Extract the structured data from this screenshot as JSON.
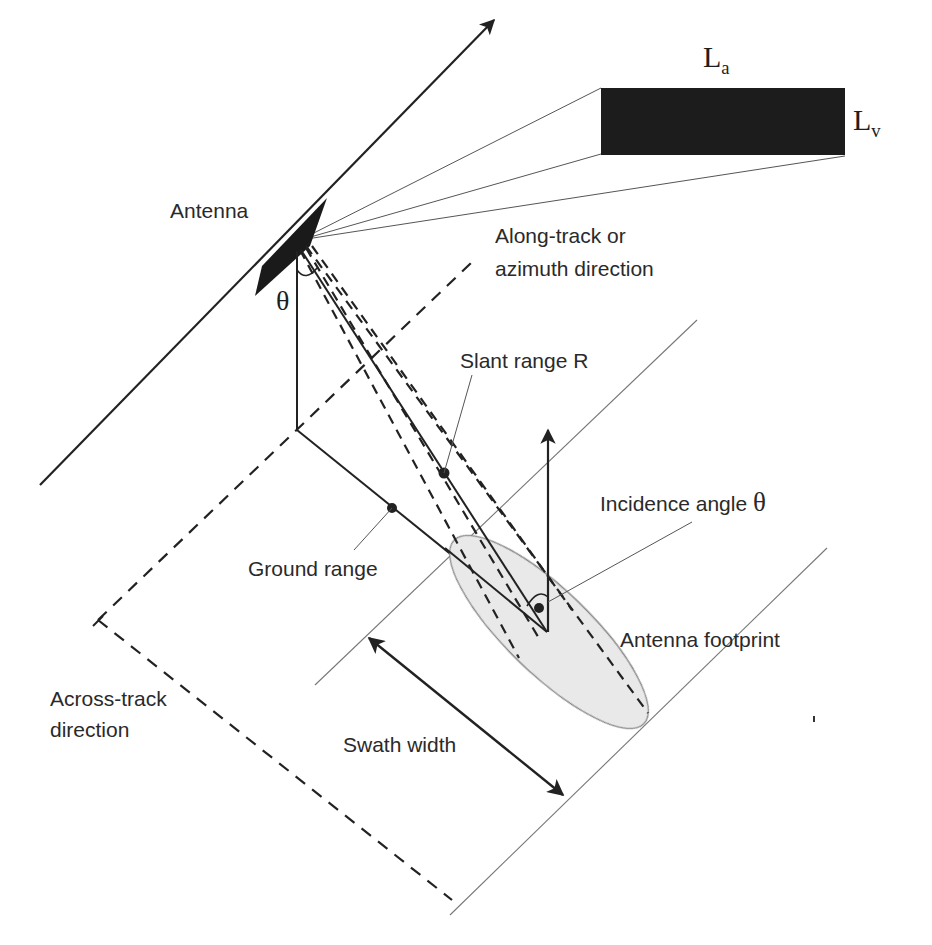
{
  "figure": {
    "colors": {
      "line": "#222222",
      "thin_line": "#777777",
      "antenna_fill": "#1a1a1a",
      "footprint_fill": "#ebebeb",
      "footprint_stroke": "#888888",
      "text": "#2a2a2a"
    }
  },
  "antenna_panel": {
    "length_label": "L",
    "length_sub": "a",
    "height_label": "L",
    "height_sub": "v"
  },
  "labels": {
    "antenna": "Antenna",
    "along_track_line1": "Along-track or",
    "along_track_line2": "azimuth direction",
    "look_angle": "θ",
    "slant_range": "Slant range R",
    "incidence_angle_text": "Incidence angle ",
    "incidence_angle_symbol": "θ",
    "ground_range": "Ground range",
    "antenna_footprint": "Antenna footprint",
    "across_track_line1": "Across-track",
    "across_track_line2": "direction",
    "swath_width": "Swath width"
  }
}
